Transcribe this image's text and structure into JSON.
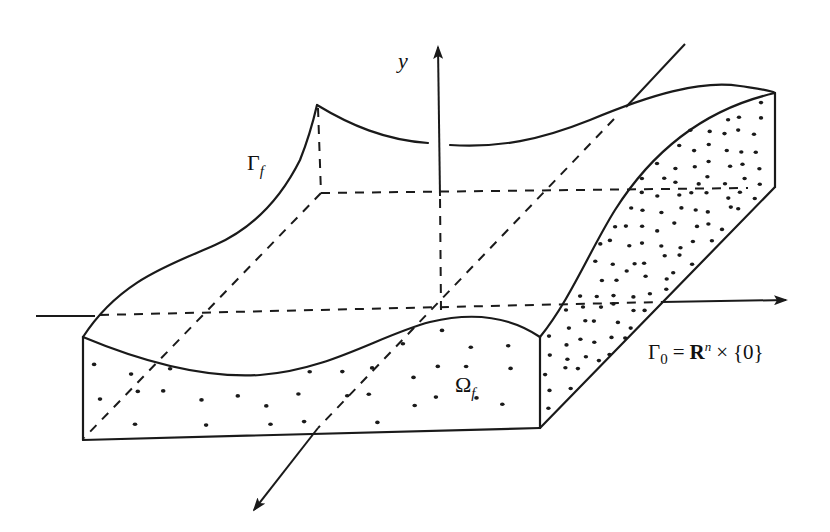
{
  "figure": {
    "labels": {
      "y_axis": "y",
      "gamma_f": {
        "symbol": "Γ",
        "subscript": "f"
      },
      "omega_f": {
        "symbol": "Ω",
        "subscript": "f"
      },
      "gamma_0": {
        "symbol": "Γ",
        "subscript": "0",
        "equals": "=",
        "R": "R",
        "superscript": "n",
        "times": "×",
        "set": "{0}"
      }
    },
    "colors": {
      "ink": "#1a1a1a",
      "background": "#ffffff"
    }
  }
}
